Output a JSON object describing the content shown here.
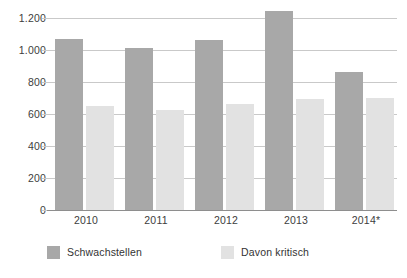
{
  "chart_data": {
    "type": "bar",
    "title": "",
    "subtitle": "",
    "xlabel": "",
    "ylabel": "",
    "categories": [
      "2010",
      "2011",
      "2012",
      "2013",
      "2014*"
    ],
    "series": [
      {
        "name": "Schwachstellen",
        "color": "#a8a8a8",
        "values": [
          1070,
          1015,
          1060,
          1245,
          865
        ]
      },
      {
        "name": "Davon kritisch",
        "color": "#e2e2e2",
        "values": [
          650,
          625,
          660,
          695,
          700
        ]
      }
    ],
    "ylim": [
      0,
      1300
    ],
    "yticks": [
      0,
      200,
      400,
      600,
      800,
      1000,
      1200
    ],
    "ytick_labels": [
      "0",
      "200",
      "400",
      "600",
      "800",
      "1.000",
      "1.200"
    ],
    "grid": true,
    "legend_position": "bottom-left",
    "annotations": [
      "* Werte für 2014 mit Sternchen gekennzeichnet"
    ]
  },
  "axis": {
    "y_labels": [
      "1.200",
      "1.000",
      "800",
      "600",
      "400",
      "200",
      "0"
    ],
    "x_labels": [
      "2010",
      "2011",
      "2012",
      "2013",
      "2014*"
    ]
  },
  "legend": {
    "items": [
      {
        "label": "Schwachstellen",
        "color": "#a8a8a8"
      },
      {
        "label": "Davon kritisch",
        "color": "#e2e2e2"
      }
    ]
  }
}
